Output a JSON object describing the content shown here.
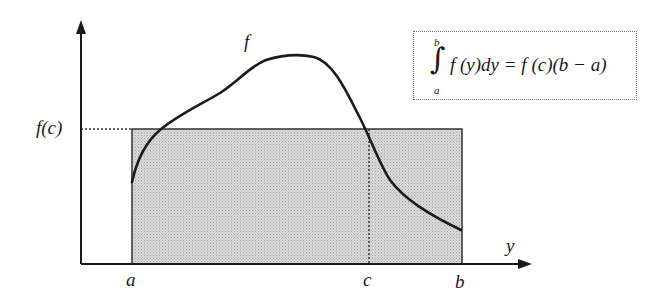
{
  "diagram": {
    "labels": {
      "function": "f",
      "mean_value": "f(c)",
      "x_axis": "y",
      "a": "a",
      "b": "b",
      "c": "c"
    },
    "formula": {
      "upper_limit": "b",
      "lower_limit": "a",
      "integral_sign": "∫",
      "expression": "f (y)dy = f (c)(b − a)"
    },
    "colors": {
      "curve": "#1a1a1a",
      "axes": "#1a1a1a",
      "rectangle_fill": "#cfcfcf",
      "rectangle_stroke": "#333333",
      "dotted_guides": "#333333"
    }
  }
}
